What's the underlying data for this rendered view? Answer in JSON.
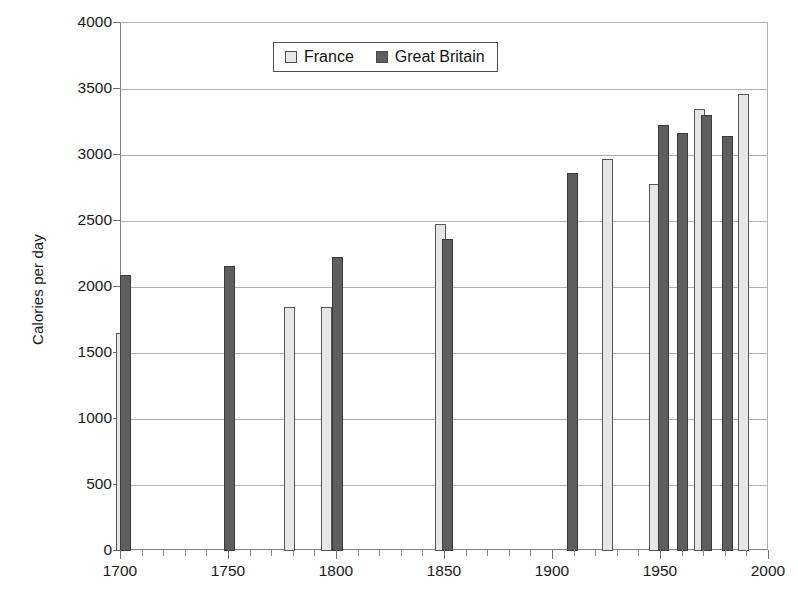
{
  "chart_data": {
    "type": "bar",
    "title": "",
    "xlabel": "",
    "ylabel": "Calories per day",
    "xlim": [
      1700,
      2000
    ],
    "ylim": [
      0,
      4000
    ],
    "grid": true,
    "legend_position": "top-center",
    "y_ticks": [
      0,
      500,
      1000,
      1500,
      2000,
      2500,
      3000,
      3500,
      4000
    ],
    "y_tick_labels": [
      "0",
      "500",
      "1000",
      "1500",
      "2000",
      "2500",
      "3000",
      "3500",
      "4000"
    ],
    "x_ticks": [
      1700,
      1750,
      1800,
      1850,
      1900,
      1950,
      2000
    ],
    "x_tick_labels": [
      "1700",
      "1750",
      "1800",
      "1850",
      "1900",
      "1950",
      "2000"
    ],
    "x_minor_tick_step": 10,
    "series": [
      {
        "name": "France",
        "color": "#e6e6e6",
        "points": [
          {
            "x": 1700,
            "y": 1650
          },
          {
            "x": 1778,
            "y": 1845
          },
          {
            "x": 1795,
            "y": 1845
          },
          {
            "x": 1848,
            "y": 2480
          },
          {
            "x": 1925,
            "y": 2970
          },
          {
            "x": 1947,
            "y": 2780
          },
          {
            "x": 1968,
            "y": 3350
          },
          {
            "x": 1988,
            "y": 3460
          }
        ]
      },
      {
        "name": "Great Britain",
        "color": "#5e5e5e",
        "points": [
          {
            "x": 1702,
            "y": 2090
          },
          {
            "x": 1750,
            "y": 2160
          },
          {
            "x": 1800,
            "y": 2230
          },
          {
            "x": 1851,
            "y": 2360
          },
          {
            "x": 1909,
            "y": 2860
          },
          {
            "x": 1951,
            "y": 3230
          },
          {
            "x": 1960,
            "y": 3170
          },
          {
            "x": 1971,
            "y": 3300
          },
          {
            "x": 1981,
            "y": 3145
          }
        ]
      }
    ]
  },
  "legend": {
    "entries": [
      {
        "label": "France",
        "swatch": "france"
      },
      {
        "label": "Great Britain",
        "swatch": "gb"
      }
    ]
  }
}
